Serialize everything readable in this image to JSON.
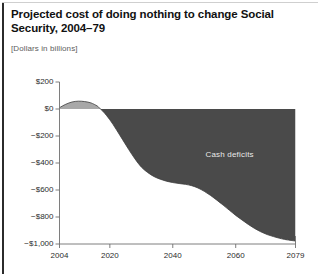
{
  "figure": {
    "title": "Projected cost of doing nothing to change Social Security, 2004–79",
    "subtitle": "[Dollars in billions]"
  },
  "colors": {
    "surplus_fill": "#a8a8a8",
    "deficit_fill": "#4a4a4a",
    "axis": "#6f6f6f",
    "text": "#2c2c2c",
    "title_text": "#111111",
    "series_label_text": "#e9e9e9",
    "frame": "#2b2b2b",
    "background": "#ffffff"
  },
  "chart_data": {
    "type": "area",
    "title": "Projected cost of doing nothing to change Social Security, 2004–79",
    "subtitle": "[Dollars in billions]",
    "xlabel": "",
    "ylabel": "",
    "grid": false,
    "legend": false,
    "annotations": [
      {
        "text": "Cash deficits",
        "x": 2058,
        "y": -340
      }
    ],
    "xlim": [
      2004,
      2079
    ],
    "ylim": [
      -1000,
      200
    ],
    "xticks": [
      2004,
      2020,
      2040,
      2060,
      2079
    ],
    "xticklabels": [
      "2004",
      "2020",
      "2040",
      "2060",
      "2079"
    ],
    "yticks": [
      200,
      0,
      -200,
      -400,
      -600,
      -800,
      -1000
    ],
    "yticklabels": [
      "$200",
      "$0",
      "−$200",
      "−$400",
      "−$600",
      "−$800",
      "−$1,000"
    ],
    "series": [
      {
        "name": "Social Security cash balance",
        "x": [
          2004,
          2006,
          2008,
          2010,
          2012,
          2014,
          2016,
          2017,
          2018,
          2020,
          2022,
          2024,
          2026,
          2028,
          2030,
          2032,
          2034,
          2036,
          2038,
          2040,
          2042,
          2044,
          2046,
          2048,
          2050,
          2052,
          2054,
          2056,
          2058,
          2060,
          2062,
          2064,
          2066,
          2068,
          2070,
          2072,
          2074,
          2076,
          2079
        ],
        "values": [
          10,
          35,
          52,
          58,
          55,
          45,
          22,
          0,
          -22,
          -80,
          -150,
          -225,
          -300,
          -370,
          -430,
          -470,
          -500,
          -520,
          -535,
          -545,
          -552,
          -558,
          -568,
          -585,
          -610,
          -640,
          -675,
          -712,
          -750,
          -788,
          -822,
          -855,
          -885,
          -910,
          -930,
          -945,
          -958,
          -968,
          -978
        ]
      }
    ]
  }
}
